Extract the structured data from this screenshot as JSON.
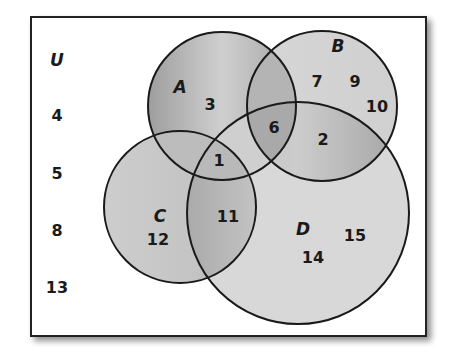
{
  "diagram": {
    "type": "venn",
    "universe_label": "U",
    "sets": [
      {
        "name": "A",
        "label": "A"
      },
      {
        "name": "B",
        "label": "B"
      },
      {
        "name": "C",
        "label": "C"
      },
      {
        "name": "D",
        "label": "D"
      }
    ],
    "outside_elements": [
      "4",
      "5",
      "8",
      "13"
    ],
    "regions": {
      "A_only": [
        "3"
      ],
      "B_only": [
        "7",
        "9",
        "10"
      ],
      "C_only": [
        "12"
      ],
      "D_only": [
        "14",
        "15"
      ],
      "A_B_D": [
        "6"
      ],
      "B_D": [
        "2"
      ],
      "A_C_D": [
        "1"
      ],
      "C_D": [
        "11"
      ]
    },
    "colors": {
      "frame": "#222222",
      "circle_stroke": "#1a1a1a",
      "fill_light": "#d9d9d9",
      "fill_dark": "#a8a8a8",
      "text": "#1a1a1a"
    }
  }
}
